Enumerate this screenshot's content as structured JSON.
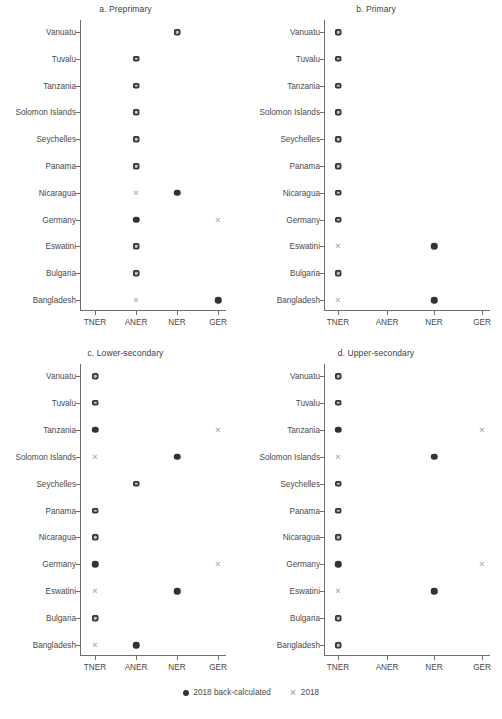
{
  "figure": {
    "width": 502,
    "height": 719,
    "background": "#ffffff",
    "marker_colors": {
      "back_calculated": "#323232",
      "reported": "#b4b4b4"
    }
  },
  "legend": {
    "position": "bottom-center",
    "entries": [
      {
        "marker": "filled-circle",
        "label": "2018  back-calculated"
      },
      {
        "marker": "x-cross",
        "label": "2018"
      }
    ]
  },
  "chart_data": {
    "type": "scatter",
    "title": "",
    "xlabel": "",
    "ylabel": "",
    "grid": false,
    "legend_position": "bottom",
    "x_categories": [
      "TNER",
      "ANER",
      "NER",
      "GER"
    ],
    "y_categories": [
      "Vanuatu",
      "Tuvalu",
      "Tanzania",
      "Solomon Islands",
      "Seychelles",
      "Panama",
      "Nicaragua",
      "Germany",
      "Eswatini",
      "Bulgaria",
      "Bangladesh"
    ],
    "series": [
      {
        "name": "2018  back-calculated",
        "marker": "filled-circle",
        "color": "#323232"
      },
      {
        "name": "2018",
        "marker": "x-cross",
        "color": "#b4b4b4"
      }
    ],
    "panels": [
      {
        "id": "a",
        "title": "a. Preprimary",
        "points": [
          {
            "country": "Vanuatu",
            "back_calculated": "NER",
            "reported": "NER"
          },
          {
            "country": "Tuvalu",
            "back_calculated": "ANER",
            "reported": "ANER"
          },
          {
            "country": "Tanzania",
            "back_calculated": "ANER",
            "reported": "ANER"
          },
          {
            "country": "Solomon Islands",
            "back_calculated": "ANER",
            "reported": "ANER"
          },
          {
            "country": "Seychelles",
            "back_calculated": "ANER",
            "reported": "ANER"
          },
          {
            "country": "Panama",
            "back_calculated": "ANER",
            "reported": "ANER"
          },
          {
            "country": "Nicaragua",
            "back_calculated": "NER",
            "reported": "ANER"
          },
          {
            "country": "Germany",
            "back_calculated": "ANER",
            "reported": "GER"
          },
          {
            "country": "Eswatini",
            "back_calculated": "ANER",
            "reported": "ANER"
          },
          {
            "country": "Bulgaria",
            "back_calculated": "ANER",
            "reported": "ANER"
          },
          {
            "country": "Bangladesh",
            "back_calculated": "GER",
            "reported": "ANER"
          }
        ]
      },
      {
        "id": "b",
        "title": "b. Primary",
        "points": [
          {
            "country": "Vanuatu",
            "back_calculated": "TNER",
            "reported": "TNER"
          },
          {
            "country": "Tuvalu",
            "back_calculated": "TNER",
            "reported": "TNER"
          },
          {
            "country": "Tanzania",
            "back_calculated": "TNER",
            "reported": "TNER"
          },
          {
            "country": "Solomon Islands",
            "back_calculated": "TNER",
            "reported": "TNER"
          },
          {
            "country": "Seychelles",
            "back_calculated": "TNER",
            "reported": "TNER"
          },
          {
            "country": "Panama",
            "back_calculated": "TNER",
            "reported": "TNER"
          },
          {
            "country": "Nicaragua",
            "back_calculated": "TNER",
            "reported": "TNER"
          },
          {
            "country": "Germany",
            "back_calculated": "TNER",
            "reported": "TNER"
          },
          {
            "country": "Eswatini",
            "back_calculated": "NER",
            "reported": "TNER"
          },
          {
            "country": "Bulgaria",
            "back_calculated": "TNER",
            "reported": "TNER"
          },
          {
            "country": "Bangladesh",
            "back_calculated": "NER",
            "reported": "TNER"
          }
        ]
      },
      {
        "id": "c",
        "title": "c. Lower-secondary",
        "points": [
          {
            "country": "Vanuatu",
            "back_calculated": "TNER",
            "reported": "TNER"
          },
          {
            "country": "Tuvalu",
            "back_calculated": "TNER",
            "reported": "TNER"
          },
          {
            "country": "Tanzania",
            "back_calculated": "TNER",
            "reported": "GER"
          },
          {
            "country": "Solomon Islands",
            "back_calculated": "NER",
            "reported": "TNER"
          },
          {
            "country": "Seychelles",
            "back_calculated": "ANER",
            "reported": "ANER"
          },
          {
            "country": "Panama",
            "back_calculated": "TNER",
            "reported": "TNER"
          },
          {
            "country": "Nicaragua",
            "back_calculated": "TNER",
            "reported": "TNER"
          },
          {
            "country": "Germany",
            "back_calculated": "TNER",
            "reported": "GER"
          },
          {
            "country": "Eswatini",
            "back_calculated": "NER",
            "reported": "TNER"
          },
          {
            "country": "Bulgaria",
            "back_calculated": "TNER",
            "reported": "TNER"
          },
          {
            "country": "Bangladesh",
            "back_calculated": "ANER",
            "reported": "TNER"
          }
        ]
      },
      {
        "id": "d",
        "title": "d. Upper-secondary",
        "points": [
          {
            "country": "Vanuatu",
            "back_calculated": "TNER",
            "reported": "TNER"
          },
          {
            "country": "Tuvalu",
            "back_calculated": "TNER",
            "reported": "TNER"
          },
          {
            "country": "Tanzania",
            "back_calculated": "TNER",
            "reported": "GER"
          },
          {
            "country": "Solomon Islands",
            "back_calculated": "NER",
            "reported": "TNER"
          },
          {
            "country": "Seychelles",
            "back_calculated": "TNER",
            "reported": "TNER"
          },
          {
            "country": "Panama",
            "back_calculated": "TNER",
            "reported": "TNER"
          },
          {
            "country": "Nicaragua",
            "back_calculated": "TNER",
            "reported": "TNER"
          },
          {
            "country": "Germany",
            "back_calculated": "TNER",
            "reported": "GER"
          },
          {
            "country": "Eswatini",
            "back_calculated": "NER",
            "reported": "TNER"
          },
          {
            "country": "Bulgaria",
            "back_calculated": "TNER",
            "reported": "TNER"
          },
          {
            "country": "Bangladesh",
            "back_calculated": "TNER",
            "reported": "TNER"
          }
        ]
      }
    ]
  }
}
